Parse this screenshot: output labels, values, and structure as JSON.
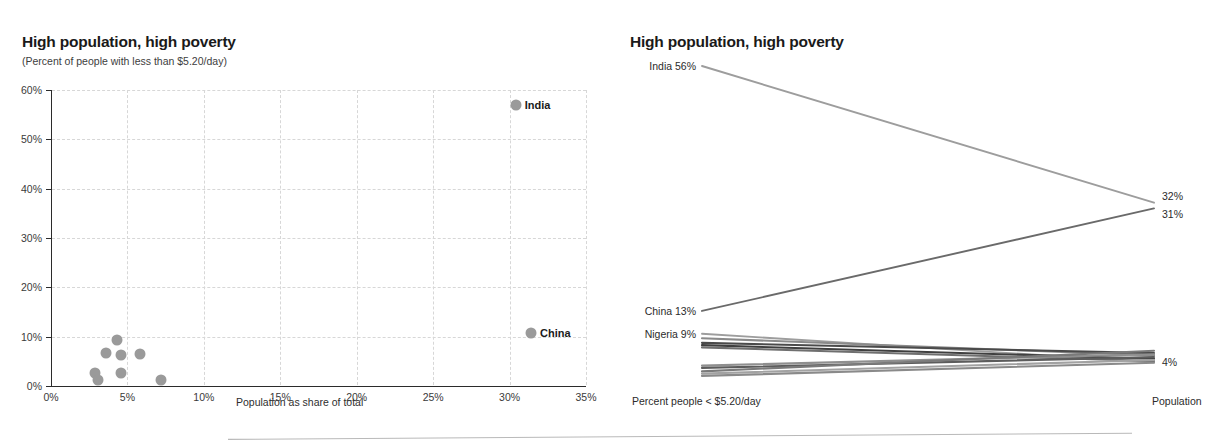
{
  "scatter": {
    "title": "High population, high poverty",
    "subtitle": "(Percent of people with less than $5.20/day)",
    "xlabel": "Population as share of total",
    "labels": {
      "india": "India",
      "china": "China"
    }
  },
  "slope": {
    "title": "High population, high poverty",
    "left_axis_label": "Percent people < $5.20/day",
    "right_axis_label": "Population",
    "left_labels": [
      {
        "text": "India 56%"
      },
      {
        "text": "China 13%"
      },
      {
        "text": "Nigeria 9%"
      }
    ],
    "right_labels": [
      {
        "text": "32%"
      },
      {
        "text": "31%"
      },
      {
        "text": "4%"
      }
    ]
  },
  "chart_data": [
    {
      "type": "scatter",
      "title": "High population, high poverty",
      "subtitle": "(Percent of people with less than $5.20/day)",
      "xlabel": "Population as share of total",
      "ylabel": "Percent of people with less than $5.20/day",
      "xlim": [
        0,
        35
      ],
      "ylim": [
        0,
        60
      ],
      "xticks": [
        "0%",
        "5%",
        "10%",
        "15%",
        "20%",
        "25%",
        "30%",
        "35%"
      ],
      "xtick_values": [
        0,
        5,
        10,
        15,
        20,
        25,
        30,
        35
      ],
      "yticks": [
        "0%",
        "10%",
        "20%",
        "30%",
        "40%",
        "50%",
        "60%"
      ],
      "ytick_values": [
        0,
        10,
        20,
        30,
        40,
        50,
        60
      ],
      "grid": true,
      "marker_color": "#9a9a9a",
      "points": [
        {
          "label": "India",
          "x": 30.4,
          "y": 57.0,
          "labeled": true
        },
        {
          "label": "China",
          "x": 31.4,
          "y": 10.8,
          "labeled": true
        },
        {
          "label": "",
          "x": 4.3,
          "y": 9.3,
          "labeled": false
        },
        {
          "label": "",
          "x": 3.6,
          "y": 6.6,
          "labeled": false
        },
        {
          "label": "",
          "x": 4.6,
          "y": 6.2,
          "labeled": false
        },
        {
          "label": "",
          "x": 5.8,
          "y": 6.5,
          "labeled": false
        },
        {
          "label": "",
          "x": 4.6,
          "y": 2.7,
          "labeled": false
        },
        {
          "label": "",
          "x": 2.9,
          "y": 2.6,
          "labeled": false
        },
        {
          "label": "",
          "x": 3.1,
          "y": 1.2,
          "labeled": false
        },
        {
          "label": "",
          "x": 7.2,
          "y": 1.3,
          "labeled": false
        }
      ]
    },
    {
      "type": "line",
      "title": "High population, high poverty",
      "subtitle": "",
      "xlabel": "",
      "ylabel": "",
      "x": [
        "Percent people < $5.20/day",
        "Population"
      ],
      "legend_position": "none",
      "grid": false,
      "series": [
        {
          "name": "India",
          "values": [
            56,
            32
          ],
          "label_left": "India 56%",
          "label_right": "32%",
          "color": "#9d9d9d"
        },
        {
          "name": "China",
          "values": [
            13,
            31
          ],
          "label_left": "China 13%",
          "label_right": "31%",
          "color": "#6a6a6a"
        },
        {
          "name": "Nigeria",
          "values": [
            9,
            4
          ],
          "label_left": "Nigeria 9%",
          "label_right": "4%",
          "color": "#9d9d9d"
        },
        {
          "name": "other-1",
          "values": [
            8.2,
            5.2
          ],
          "label_left": "",
          "label_right": "",
          "color": "#8a8a8a"
        },
        {
          "name": "other-2",
          "values": [
            7.4,
            5.6
          ],
          "label_left": "",
          "label_right": "",
          "color": "#4a4a4a"
        },
        {
          "name": "other-3",
          "values": [
            7.0,
            4.6
          ],
          "label_left": "",
          "label_right": "",
          "color": "#3f3f3f"
        },
        {
          "name": "other-4",
          "values": [
            6.6,
            4.2
          ],
          "label_left": "",
          "label_right": "",
          "color": "#6f6f6f"
        },
        {
          "name": "other-5",
          "values": [
            3.4,
            5.4
          ],
          "label_left": "",
          "label_right": "",
          "color": "#8f8f8f"
        },
        {
          "name": "other-6",
          "values": [
            3.0,
            4.9
          ],
          "label_left": "",
          "label_right": "",
          "color": "#5c5c5c"
        },
        {
          "name": "other-7",
          "values": [
            2.4,
            6.0
          ],
          "label_left": "",
          "label_right": "",
          "color": "#7a7a7a"
        },
        {
          "name": "other-8",
          "values": [
            2.0,
            4.4
          ],
          "label_left": "",
          "label_right": "",
          "color": "#a2a2a2"
        },
        {
          "name": "other-9",
          "values": [
            1.6,
            3.9
          ],
          "label_left": "",
          "label_right": "",
          "color": "#8a8a8a"
        }
      ]
    }
  ]
}
